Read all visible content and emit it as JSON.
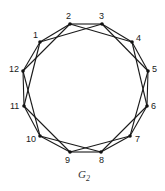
{
  "figure": {
    "caption": "G",
    "caption_subscript": "2",
    "graph_type": "circulant C12(1,2)",
    "colors": {
      "line": "#1a1a1a",
      "vertex": "#111111",
      "background": "#ffffff"
    }
  },
  "vertices": [
    {
      "id": "1",
      "x": 40,
      "y": 42,
      "label_x": 33,
      "label_y": 38
    },
    {
      "id": "2",
      "x": 70,
      "y": 24,
      "label_x": 66,
      "label_y": 19
    },
    {
      "id": "3",
      "x": 102,
      "y": 24,
      "label_x": 99,
      "label_y": 19
    },
    {
      "id": "4",
      "x": 132,
      "y": 42,
      "label_x": 136,
      "label_y": 41
    },
    {
      "id": "5",
      "x": 148,
      "y": 71,
      "label_x": 152,
      "label_y": 72
    },
    {
      "id": "6",
      "x": 147,
      "y": 106,
      "label_x": 151,
      "label_y": 109
    },
    {
      "id": "7",
      "x": 130,
      "y": 136,
      "label_x": 135,
      "label_y": 142
    },
    {
      "id": "8",
      "x": 101,
      "y": 152,
      "label_x": 99,
      "label_y": 163
    },
    {
      "id": "9",
      "x": 70,
      "y": 152,
      "label_x": 65,
      "label_y": 163
    },
    {
      "id": "10",
      "x": 40,
      "y": 136,
      "label_x": 26,
      "label_y": 142
    },
    {
      "id": "11",
      "x": 24,
      "y": 106,
      "label_x": 10,
      "label_y": 109
    },
    {
      "id": "12",
      "x": 23,
      "y": 71,
      "label_x": 9,
      "label_y": 72
    }
  ],
  "edges": [
    [
      "1",
      "2"
    ],
    [
      "2",
      "3"
    ],
    [
      "3",
      "4"
    ],
    [
      "4",
      "5"
    ],
    [
      "5",
      "6"
    ],
    [
      "6",
      "7"
    ],
    [
      "7",
      "8"
    ],
    [
      "8",
      "9"
    ],
    [
      "9",
      "10"
    ],
    [
      "10",
      "11"
    ],
    [
      "11",
      "12"
    ],
    [
      "12",
      "1"
    ],
    [
      "1",
      "3"
    ],
    [
      "2",
      "4"
    ],
    [
      "3",
      "5"
    ],
    [
      "4",
      "6"
    ],
    [
      "5",
      "7"
    ],
    [
      "6",
      "8"
    ],
    [
      "7",
      "9"
    ],
    [
      "8",
      "10"
    ],
    [
      "9",
      "11"
    ],
    [
      "10",
      "12"
    ],
    [
      "11",
      "1"
    ],
    [
      "12",
      "2"
    ]
  ]
}
